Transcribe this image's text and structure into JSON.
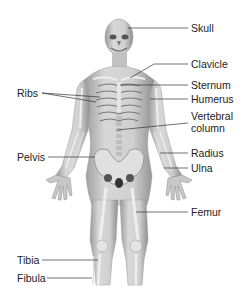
{
  "diagram": {
    "labels_right": [
      {
        "id": "skull",
        "text": "Skull"
      },
      {
        "id": "clavicle",
        "text": "Clavicle"
      },
      {
        "id": "sternum",
        "text": "Sternum"
      },
      {
        "id": "humerus",
        "text": "Humerus"
      },
      {
        "id": "vertebral-column",
        "text": "Vertebral\ncolumn",
        "line1": "Vertebral",
        "line2": "column"
      },
      {
        "id": "radius",
        "text": "Radius"
      },
      {
        "id": "ulna",
        "text": "Ulna"
      },
      {
        "id": "femur",
        "text": "Femur"
      }
    ],
    "labels_left": [
      {
        "id": "ribs",
        "text": "Ribs"
      },
      {
        "id": "pelvis",
        "text": "Pelvis"
      },
      {
        "id": "tibia",
        "text": "Tibia"
      },
      {
        "id": "fibula",
        "text": "Fibula"
      }
    ],
    "colors": {
      "background": "#ffffff",
      "skin": "#cfcfcf",
      "bone": "#ededed",
      "shadow": "#8a8a8a",
      "leader_line": "#333333",
      "text": "#222222"
    }
  }
}
